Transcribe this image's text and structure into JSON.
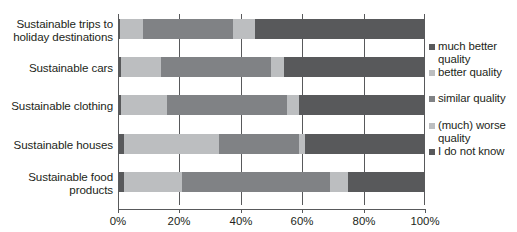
{
  "chart_data": {
    "type": "bar",
    "orientation": "horizontal",
    "stacked": true,
    "stack_mode": "percent",
    "title": "",
    "xlabel": "",
    "ylabel": "",
    "xlim": [
      0,
      100
    ],
    "xticks": [
      "0%",
      "20%",
      "40%",
      "60%",
      "80%",
      "100%"
    ],
    "xtick_values": [
      0,
      20,
      40,
      60,
      80,
      100
    ],
    "grid": true,
    "grid_axis": "x",
    "legend_position": "right",
    "categories": [
      "Sustainable trips to\nholiday destinations",
      "Sustainable cars",
      "Sustainable clothing",
      "Sustainable houses",
      "Sustainable food\nproducts"
    ],
    "series": [
      {
        "name": "much better\nquality",
        "color": "#58595b",
        "values": [
          0.5,
          1.0,
          1.0,
          2.0,
          2.0
        ]
      },
      {
        "name": "better quality",
        "color": "#bcbec0",
        "values": [
          7.5,
          13.0,
          15.0,
          31.0,
          19.0
        ]
      },
      {
        "name": "similar quality",
        "color": "#808285",
        "values": [
          29.5,
          36.0,
          39.0,
          26.0,
          48.0
        ]
      },
      {
        "name": "(much) worse\nquality",
        "color": "#bcbec0",
        "values": [
          7.0,
          4.0,
          4.0,
          2.0,
          6.0
        ]
      },
      {
        "name": "I do not know",
        "color": "#58595b",
        "values": [
          55.5,
          46.0,
          41.0,
          39.0,
          25.0
        ]
      }
    ]
  },
  "legend": {
    "items": [
      {
        "label": "much better\nquality",
        "swatch": "#58595b"
      },
      {
        "label": "better quality",
        "swatch": "#bcbec0"
      },
      {
        "label": "similar quality",
        "swatch": "#808285"
      },
      {
        "label": "(much) worse\nquality",
        "swatch": "#bcbec0"
      },
      {
        "label": "I do not know",
        "swatch": "#58595b"
      }
    ]
  },
  "axis": {
    "ticks": [
      "0%",
      "20%",
      "40%",
      "60%",
      "80%",
      "100%"
    ]
  },
  "colors": {
    "axis": "#58595b",
    "text": "#231f20",
    "background": "#ffffff"
  }
}
